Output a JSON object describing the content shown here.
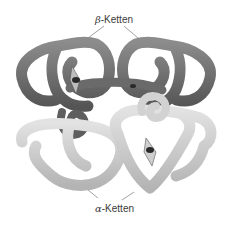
{
  "figure": {
    "labels": {
      "beta": {
        "greek": "β",
        "text": "-Ketten"
      },
      "alpha": {
        "greek": "α",
        "text": "-Ketten"
      }
    },
    "colors": {
      "beta_chain": "#6e6e6e",
      "beta_highlight": "#9a9a9a",
      "alpha_chain": "#c8c8c8",
      "alpha_highlight": "#e6e6e6",
      "heme": "#2a2a2a",
      "leader_line": "#8a8a8a",
      "background": "#ffffff"
    }
  }
}
